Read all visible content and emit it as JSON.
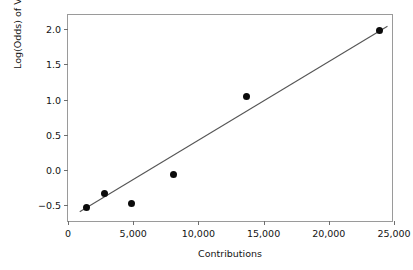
{
  "chart_data": {
    "type": "scatter",
    "title": "",
    "xlabel": "Contributions",
    "ylabel": "Log(Odds) of Vote With",
    "xlim": [
      0,
      25000
    ],
    "ylim": [
      -0.75,
      2.2
    ],
    "grid": false,
    "legend": null,
    "xticks": [
      0,
      5000,
      10000,
      15000,
      20000,
      25000
    ],
    "xticklabels": [
      "0",
      "5,000",
      "10,000",
      "15,000",
      "20,000",
      "25,000"
    ],
    "yticks": [
      -0.5,
      0.0,
      0.5,
      1.0,
      1.5,
      2.0
    ],
    "yticklabels": [
      "−0.5",
      "0.0",
      "0.5",
      "1.0",
      "1.5",
      "2.0"
    ],
    "points": [
      {
        "x": 1400,
        "y": -0.53
      },
      {
        "x": 2800,
        "y": -0.33
      },
      {
        "x": 4900,
        "y": -0.48
      },
      {
        "x": 8100,
        "y": -0.06
      },
      {
        "x": 13700,
        "y": 1.04
      },
      {
        "x": 23900,
        "y": 1.98
      }
    ],
    "series": [
      {
        "name": "observed",
        "type": "scatter",
        "marker": "filled-circle",
        "color": "#0b0b0b",
        "x": [
          1400,
          2800,
          4900,
          8100,
          13700,
          23900
        ],
        "values": [
          -0.53,
          -0.33,
          -0.48,
          -0.06,
          1.04,
          1.98
        ]
      },
      {
        "name": "fitted-line",
        "type": "line",
        "color": "#555555",
        "x": [
          900,
          24500
        ],
        "values": [
          -0.59,
          2.04
        ]
      }
    ],
    "fit_line": {
      "x_start": 900,
      "y_start": -0.59,
      "x_end": 24500,
      "y_end": 2.04,
      "color": "#555555"
    },
    "colors": {
      "marker": "#0b0b0b",
      "line": "#555555",
      "axis": "#9a9a9a",
      "tick": "#6f6f6f",
      "text": "#141414",
      "background": "#ffffff"
    }
  }
}
